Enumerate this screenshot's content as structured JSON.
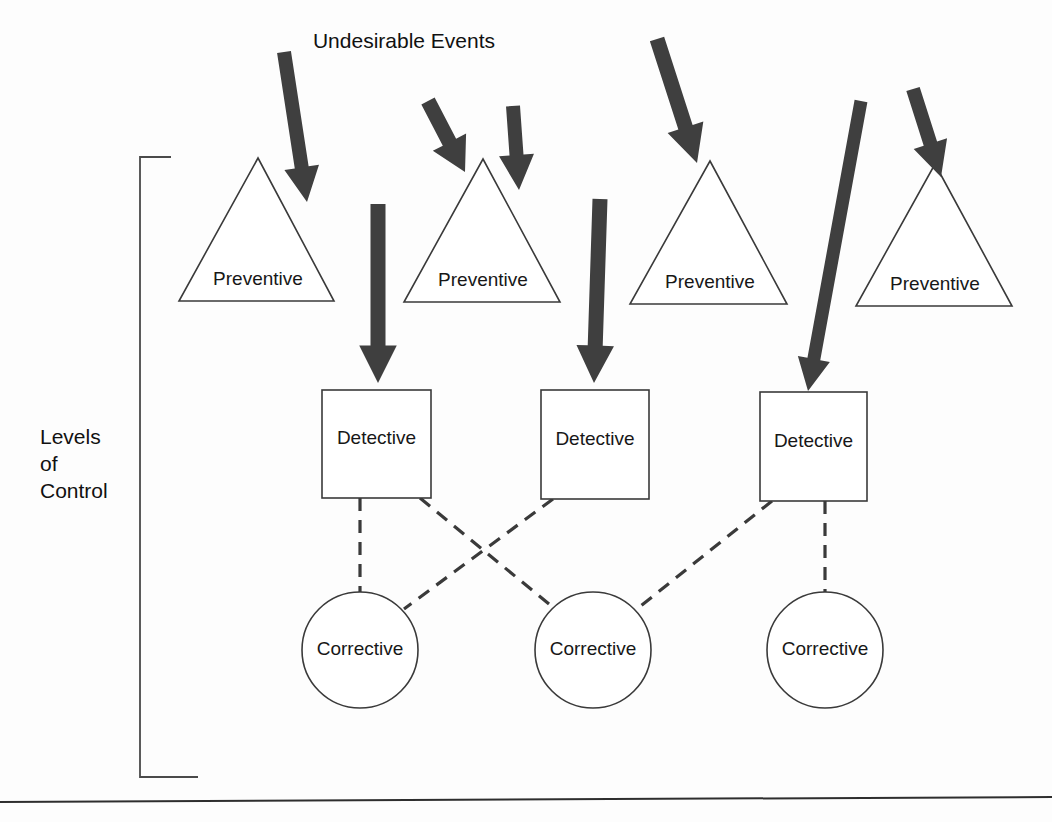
{
  "diagram": {
    "title": "Undesirable Events",
    "axis_caption_lines": [
      "Levels",
      "of",
      "Control"
    ],
    "colors": {
      "background": "#fdfdfd",
      "outline": "#3a3a3a",
      "arrow_fill": "#3f3f3f",
      "text": "#111111",
      "bracket": "#4a4a4a",
      "rule": "#2e2e2e"
    },
    "levels": [
      {
        "id": "preventive",
        "shape": "triangle",
        "label": "Preventive",
        "count": 4,
        "nodes": [
          {
            "label": "Preventive",
            "apex_x": 258,
            "apex_y": 158,
            "base_left_x": 179,
            "base_right_x": 334,
            "base_y": 301
          },
          {
            "label": "Preventive",
            "apex_x": 483,
            "apex_y": 159,
            "base_left_x": 404,
            "base_right_x": 560,
            "base_y": 302
          },
          {
            "label": "Preventive",
            "apex_x": 710,
            "apex_y": 161,
            "base_left_x": 630,
            "base_right_x": 787,
            "base_y": 304
          },
          {
            "label": "Preventive",
            "apex_x": 935,
            "apex_y": 164,
            "base_left_x": 856,
            "base_right_x": 1012,
            "base_y": 306
          }
        ]
      },
      {
        "id": "detective",
        "shape": "square",
        "label": "Detective",
        "count": 3,
        "nodes": [
          {
            "label": "Detective",
            "x": 322,
            "y": 390,
            "w": 109,
            "h": 108
          },
          {
            "label": "Detective",
            "x": 541,
            "y": 390,
            "w": 108,
            "h": 109
          },
          {
            "label": "Detective",
            "x": 760,
            "y": 392,
            "w": 107,
            "h": 109
          }
        ]
      },
      {
        "id": "corrective",
        "shape": "circle",
        "label": "Corrective",
        "count": 3,
        "nodes": [
          {
            "label": "Corrective",
            "cx": 360,
            "cy": 650,
            "r": 58
          },
          {
            "label": "Corrective",
            "cx": 593,
            "cy": 650,
            "r": 58
          },
          {
            "label": "Corrective",
            "cx": 825,
            "cy": 650,
            "r": 58
          }
        ]
      }
    ],
    "event_arrows": [
      {
        "name": "arrow-to-preventive-1",
        "x1": 284,
        "y1": 52,
        "x2": 307,
        "y2": 202,
        "width": 14
      },
      {
        "name": "arrow-to-preventive-2",
        "x1": 428,
        "y1": 101,
        "x2": 465,
        "y2": 172,
        "width": 15
      },
      {
        "name": "arrow-to-detective-1",
        "x1": 378,
        "y1": 204,
        "x2": 378,
        "y2": 383,
        "width": 15
      },
      {
        "name": "arrow-to-preventive-2b",
        "x1": 513,
        "y1": 106,
        "x2": 519,
        "y2": 190,
        "width": 14
      },
      {
        "name": "arrow-to-detective-2",
        "x1": 600,
        "y1": 199,
        "x2": 594,
        "y2": 383,
        "width": 15
      },
      {
        "name": "arrow-to-preventive-3",
        "x1": 657,
        "y1": 39,
        "x2": 697,
        "y2": 163,
        "width": 15
      },
      {
        "name": "arrow-to-detective-3",
        "x1": 861,
        "y1": 101,
        "x2": 808,
        "y2": 391,
        "width": 13
      },
      {
        "name": "arrow-to-preventive-4",
        "x1": 913,
        "y1": 89,
        "x2": 941,
        "y2": 177,
        "width": 14
      }
    ],
    "dashed_links": [
      {
        "from": "detective-1",
        "to": "corrective-1",
        "x1": 360,
        "y1": 498,
        "x2": 360,
        "y2": 592
      },
      {
        "from": "detective-1",
        "to": "corrective-2",
        "x1": 420,
        "y1": 498,
        "x2": 555,
        "y2": 609
      },
      {
        "from": "detective-2",
        "to": "corrective-1",
        "x1": 553,
        "y1": 499,
        "x2": 404,
        "y2": 609
      },
      {
        "from": "detective-3",
        "to": "corrective-2",
        "x1": 772,
        "y1": 501,
        "x2": 637,
        "y2": 609
      },
      {
        "from": "detective-3",
        "to": "corrective-3",
        "x1": 825,
        "y1": 501,
        "x2": 825,
        "y2": 592
      }
    ],
    "bracket": {
      "top_y": 157,
      "bottom_y": 777,
      "stem_x": 140,
      "top_tick_x": 171,
      "bottom_tick_x": 198
    },
    "bottom_rule": {
      "x1": 0,
      "y1": 802,
      "x2": 1052,
      "y2": 797
    },
    "title_position": {
      "x": 404,
      "y": 48
    },
    "axis_caption_position": {
      "x": 40,
      "y": 444,
      "line_height": 27
    }
  }
}
